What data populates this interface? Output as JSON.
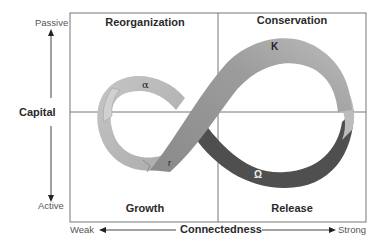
{
  "diagram": {
    "quadrants": {
      "top_left": "Reorganization",
      "top_right": "Conservation",
      "bottom_left": "Growth",
      "bottom_right": "Release"
    },
    "phases": {
      "alpha": "α",
      "K": "K",
      "r": "r",
      "omega": "Ω"
    },
    "y_axis": {
      "title": "Capital",
      "top": "Passive",
      "bottom": "Active"
    },
    "x_axis": {
      "title": "Connectedness",
      "left": "Weak",
      "right": "Strong"
    },
    "colors": {
      "light_band": "#bdbdbd",
      "mid_band": "#8f8f8f",
      "dark_band": "#4d4d4d",
      "frame": "#777777"
    }
  }
}
